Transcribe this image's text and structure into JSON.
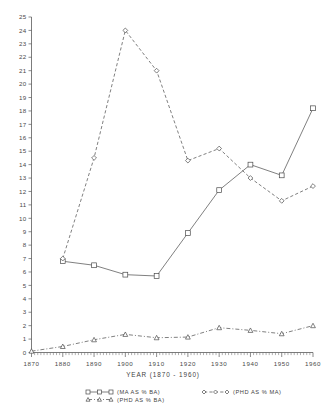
{
  "chart_data": {
    "type": "line",
    "title": "",
    "xlabel": "YEAR  (1870 - 1960)",
    "ylabel": "",
    "xlim": [
      1870,
      1960
    ],
    "ylim": [
      0,
      25
    ],
    "grid": false,
    "legend_position": "bottom",
    "x": [
      1870,
      1880,
      1890,
      1900,
      1910,
      1920,
      1930,
      1940,
      1950,
      1960
    ],
    "xtick_labels": [
      "1870",
      "1880",
      "1890",
      "1900",
      "1910",
      "1920",
      "1930",
      "1940",
      "1950",
      "1960"
    ],
    "ytick_labels": [
      "0",
      "1",
      "2",
      "3",
      "4",
      "5",
      "6",
      "7",
      "8",
      "9",
      "10",
      "11",
      "12",
      "13",
      "14",
      "15",
      "16",
      "17",
      "18",
      "19",
      "20",
      "21",
      "22",
      "23",
      "24",
      "25"
    ],
    "series": [
      {
        "name": "(MA AS % BA)",
        "marker": "square",
        "linestyle": "solid",
        "x": [
          1880,
          1890,
          1900,
          1910,
          1920,
          1930,
          1940,
          1950,
          1960
        ],
        "values": [
          6.8,
          6.5,
          5.8,
          5.7,
          8.9,
          12.1,
          14.0,
          13.2,
          18.2
        ]
      },
      {
        "name": "(PHD AS % MA)",
        "marker": "diamond",
        "linestyle": "dashed",
        "x": [
          1880,
          1890,
          1900,
          1910,
          1920,
          1930,
          1940,
          1950,
          1960
        ],
        "values": [
          7.0,
          14.5,
          24.0,
          21.0,
          14.3,
          15.2,
          13.0,
          11.3,
          12.4
        ]
      },
      {
        "name": "(PHD AS % BA)",
        "marker": "triangle",
        "linestyle": "dashdot",
        "x": [
          1870,
          1880,
          1890,
          1900,
          1910,
          1920,
          1930,
          1940,
          1950,
          1960
        ],
        "values": [
          0.1,
          0.45,
          0.95,
          1.35,
          1.1,
          1.15,
          1.85,
          1.65,
          1.4,
          2.0
        ]
      }
    ]
  },
  "legend": {
    "entries": [
      {
        "label": "(MA AS % BA)",
        "marker": "square"
      },
      {
        "label": "(PHD AS % MA)",
        "marker": "diamond"
      },
      {
        "label": "(PHD AS % BA)",
        "marker": "triangle"
      }
    ]
  },
  "axes": {
    "x_title": "YEAR  (1870 - 1960)"
  },
  "colors": {
    "line": "#555555",
    "axis": "#5a5a5a",
    "text": "#3f3f3f",
    "background": "#ffffff"
  }
}
